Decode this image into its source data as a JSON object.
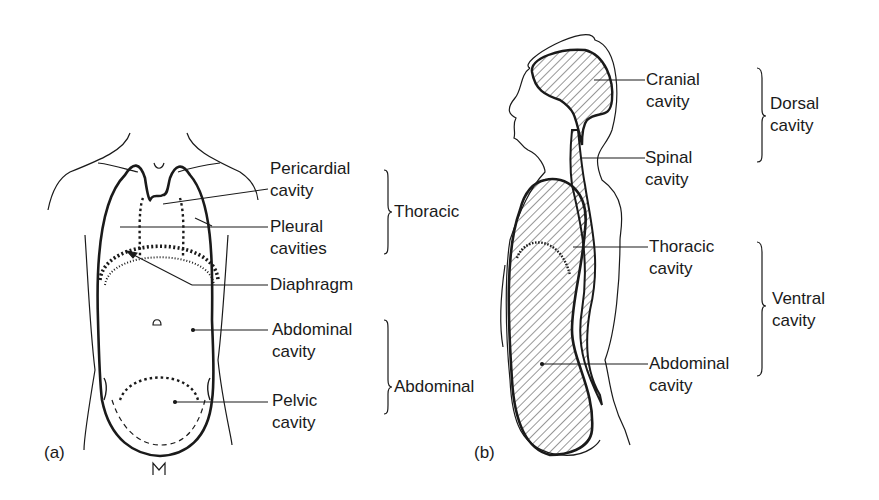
{
  "panel_a": {
    "tag": "(a)",
    "labels": {
      "pericardial": [
        "Pericardial",
        "cavity"
      ],
      "pleural": [
        "Pleural",
        "cavities"
      ],
      "diaphragm": [
        "Diaphragm"
      ],
      "abdominal": [
        "Abdominal",
        "cavity"
      ],
      "pelvic": [
        "Pelvic",
        "cavity"
      ]
    },
    "groups": {
      "thoracic": "Thoracic",
      "abdominal": "Abdominal"
    }
  },
  "panel_b": {
    "tag": "(b)",
    "labels": {
      "cranial": [
        "Cranial",
        "cavity"
      ],
      "spinal": [
        "Spinal",
        "cavity"
      ],
      "thoracic": [
        "Thoracic",
        "cavity"
      ],
      "abdominal": [
        "Abdominal",
        "cavity"
      ]
    },
    "groups": {
      "dorsal": [
        "Dorsal",
        "cavity"
      ],
      "ventral": [
        "Ventral",
        "cavity"
      ]
    }
  },
  "colors": {
    "ink": "#1a1a1a",
    "background": "#ffffff"
  }
}
